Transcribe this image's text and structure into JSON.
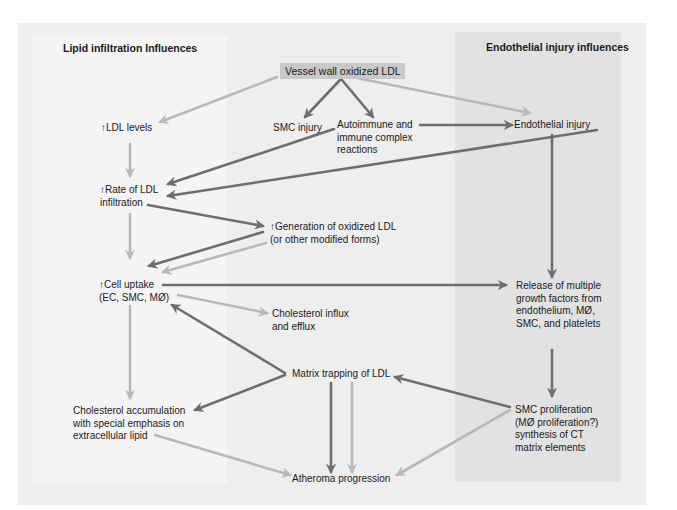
{
  "colors": {
    "outer_bg": "#eeeeee",
    "left_panel_bg": "#f4f4f4",
    "right_panel_bg": "#e2e2e2",
    "source_box_bg": "#c9c9c9",
    "arrow_dark": "#6e6e6e",
    "arrow_light": "#b8b8b8"
  },
  "panels": {
    "left_title": "Lipid infiltration Influences",
    "right_title": "Endothelial injury influences"
  },
  "nodes": {
    "source": "Vessel wall oxidized LDL",
    "ldl_levels": "↑LDL levels",
    "smc_injury": "SMC injury",
    "autoimmune": [
      "Autoimmune and",
      "immune complex",
      "reactions"
    ],
    "endothelial_injury": "Endothelial injury",
    "rate_ldl": [
      "↑Rate of LDL",
      "infiltration"
    ],
    "generation_oxldl": [
      "↑Generation of oxidized LDL",
      "(or other modified forms)"
    ],
    "cell_uptake": [
      "↑Cell uptake",
      "(EC, SMC, MØ)"
    ],
    "cholesterol_flux": [
      "Cholesterol influx",
      "and efflux"
    ],
    "growth_factors": [
      "Release of multiple",
      "growth factors from",
      "endothelium, MØ,",
      "SMC, and platelets"
    ],
    "matrix_trapping": "Matrix trapping of LDL",
    "cholesterol_accum": [
      "Cholesterol accumulation",
      "with special emphasis on",
      "extracellular lipid"
    ],
    "smc_proliferation": [
      "SMC proliferation",
      "(MØ proliferation?)",
      "synthesis of CT",
      "matrix elements"
    ],
    "atheroma": "Atheroma progression"
  },
  "edges": [
    {
      "from": "source",
      "to": "ldl_levels",
      "style": "light"
    },
    {
      "from": "source",
      "to": "smc_injury",
      "style": "dark"
    },
    {
      "from": "source",
      "to": "autoimmune",
      "style": "dark"
    },
    {
      "from": "source",
      "to": "endothelial_injury",
      "style": "light"
    },
    {
      "from": "autoimmune",
      "to": "endothelial_injury",
      "style": "dark"
    },
    {
      "from": "ldl_levels",
      "to": "rate_ldl",
      "style": "light"
    },
    {
      "from": "smc_injury",
      "to": "rate_ldl",
      "style": "dark"
    },
    {
      "from": "endothelial_injury",
      "to": "rate_ldl",
      "style": "dark"
    },
    {
      "from": "rate_ldl",
      "to": "generation_oxldl",
      "style": "dark"
    },
    {
      "from": "rate_ldl",
      "to": "cell_uptake",
      "style": "light"
    },
    {
      "from": "generation_oxldl",
      "to": "cell_uptake",
      "style": "dark"
    },
    {
      "from": "generation_oxldl",
      "to": "cell_uptake",
      "style": "light"
    },
    {
      "from": "endothelial_injury",
      "to": "growth_factors",
      "style": "dark"
    },
    {
      "from": "cell_uptake",
      "to": "growth_factors",
      "style": "dark"
    },
    {
      "from": "cell_uptake",
      "to": "cholesterol_flux",
      "style": "light"
    },
    {
      "from": "matrix_trapping",
      "to": "cell_uptake",
      "style": "dark"
    },
    {
      "from": "cell_uptake",
      "to": "cholesterol_accum",
      "style": "light"
    },
    {
      "from": "matrix_trapping",
      "to": "cholesterol_accum",
      "style": "dark"
    },
    {
      "from": "growth_factors",
      "to": "smc_proliferation",
      "style": "dark"
    },
    {
      "from": "smc_proliferation",
      "to": "matrix_trapping",
      "style": "dark"
    },
    {
      "from": "matrix_trapping",
      "to": "atheroma",
      "style": "dark"
    },
    {
      "from": "matrix_trapping",
      "to": "atheroma",
      "style": "light"
    },
    {
      "from": "cholesterol_accum",
      "to": "atheroma",
      "style": "light"
    },
    {
      "from": "smc_proliferation",
      "to": "atheroma",
      "style": "light"
    }
  ]
}
